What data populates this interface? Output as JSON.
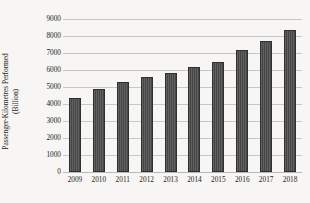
{
  "chart_data": {
    "type": "bar",
    "title": "",
    "subtitle": "",
    "xlabel": "",
    "ylabel": "Passenger-Kilometres Performed (Billion)",
    "ylabel_line1": "Passenger-Kilometres Performed",
    "ylabel_line2": "(Billion)",
    "categories": [
      "2009",
      "2010",
      "2011",
      "2012",
      "2013",
      "2014",
      "2015",
      "2016",
      "2017",
      "2018"
    ],
    "values": [
      4350,
      4890,
      5300,
      5600,
      5810,
      6200,
      6500,
      7150,
      7700,
      8350
    ],
    "series": [
      {
        "name": "Passenger-Kilometres Performed",
        "values": [
          4350,
          4890,
          5300,
          5600,
          5810,
          6200,
          6500,
          7150,
          7700,
          8350
        ]
      }
    ],
    "ylim": [
      0,
      9000
    ],
    "ytick_step": 1000,
    "ytick_labels": [
      "0",
      "1000",
      "2000",
      "3000",
      "4000",
      "5000",
      "6000",
      "7000",
      "8000",
      "9000"
    ],
    "xtick_labels": [
      "2009",
      "2010",
      "2011",
      "2012",
      "2013",
      "2014",
      "2015",
      "2016",
      "2017",
      "2018"
    ],
    "grid": "horizontal",
    "legend": "none",
    "bar_color": "#4e4e4e",
    "bar_edge_color": "#2f2f2f",
    "gridline_color": "#c9c7c4",
    "background_color": "#f7f6f4",
    "text_color": "#1d1d1d"
  }
}
